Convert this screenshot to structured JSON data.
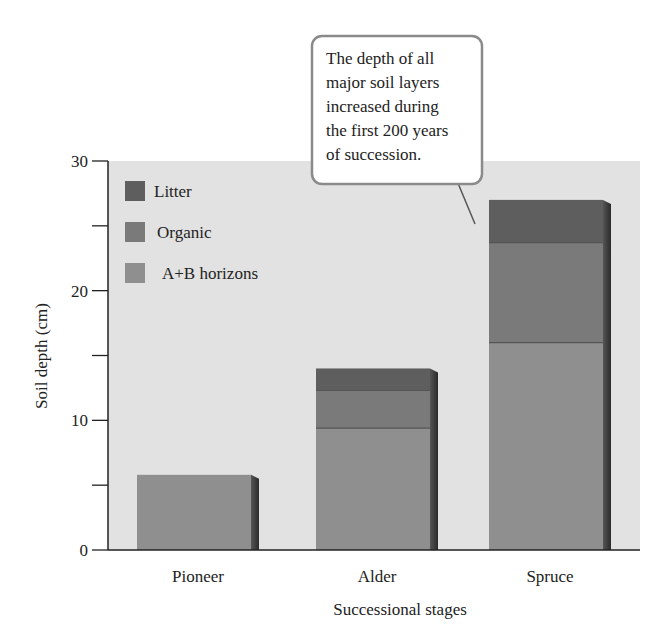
{
  "chart_data": {
    "type": "bar",
    "stacked": true,
    "title": "",
    "xlabel": "Successional stages",
    "ylabel": "Soil depth (cm)",
    "ylim": [
      0,
      30
    ],
    "yticks_major": [
      0,
      10,
      20,
      30
    ],
    "yticks_minor": [
      5,
      15,
      25
    ],
    "grid": false,
    "legend_position": "upper-left inside plot",
    "categories": [
      "Pioneer",
      "Alder",
      "Spruce"
    ],
    "series": [
      {
        "name": "A+B horizons",
        "color": "#8f8f8f",
        "values": [
          5.8,
          9.4,
          16.0
        ]
      },
      {
        "name": "Organic",
        "color": "#7a7a7a",
        "values": [
          0,
          2.9,
          7.7
        ]
      },
      {
        "name": "Litter",
        "color": "#5e5e5e",
        "values": [
          0,
          1.7,
          3.3
        ]
      }
    ],
    "legend": [
      "Litter",
      "Organic",
      "A+B horizons"
    ],
    "annotation": {
      "lines": [
        "The depth of all",
        "major soil layers",
        "increased during",
        "the first 200 years",
        "of succession."
      ],
      "points_to": "Spruce"
    }
  },
  "colors": {
    "panel": "#e2e2e2",
    "axis": "#222222",
    "callout_border": "#8a8a8a",
    "callout_fill": "#ffffff"
  }
}
